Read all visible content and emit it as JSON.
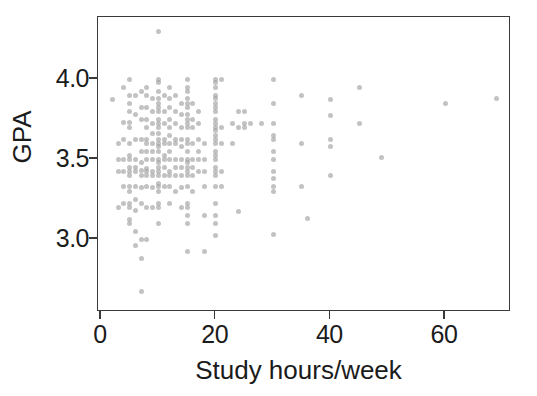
{
  "chart_data": {
    "type": "scatter",
    "title": "",
    "xlabel": "Study hours/week",
    "ylabel": "GPA",
    "xlim": [
      0,
      72
    ],
    "ylim": [
      2.6,
      4.38
    ],
    "xticks": [
      0,
      20,
      40,
      60
    ],
    "xtick_labels": [
      "0",
      "20",
      "40",
      "60"
    ],
    "yticks": [
      3.0,
      3.5,
      4.0
    ],
    "ytick_labels": [
      "3.0",
      "3.5",
      "4.0"
    ],
    "grid": false,
    "legend": false,
    "marker": {
      "shape": "circle",
      "color": "#9c9c9c",
      "opacity": 0.62,
      "size_px": 5
    },
    "frame_color": "#3a3a3a",
    "background_color": "#ffffff",
    "n_points": 232,
    "points": [
      [
        2,
        3.87
      ],
      [
        3,
        3.5
      ],
      [
        3,
        3.6
      ],
      [
        3,
        3.42
      ],
      [
        3,
        3.2
      ],
      [
        4,
        3.95
      ],
      [
        4,
        3.73
      ],
      [
        4,
        3.62
      ],
      [
        4,
        3.5
      ],
      [
        4,
        3.42
      ],
      [
        4,
        3.33
      ],
      [
        4,
        3.22
      ],
      [
        5,
        4.0
      ],
      [
        5,
        3.9
      ],
      [
        5,
        3.85
      ],
      [
        5,
        3.8
      ],
      [
        5,
        3.73
      ],
      [
        5,
        3.7
      ],
      [
        5,
        3.6
      ],
      [
        5,
        3.52
      ],
      [
        5,
        3.5
      ],
      [
        5,
        3.45
      ],
      [
        5,
        3.42
      ],
      [
        5,
        3.4
      ],
      [
        5,
        3.33
      ],
      [
        5,
        3.3
      ],
      [
        5,
        3.22
      ],
      [
        5,
        3.2
      ],
      [
        5,
        3.12
      ],
      [
        5,
        3.1
      ],
      [
        6,
        3.9
      ],
      [
        6,
        3.78
      ],
      [
        6,
        3.62
      ],
      [
        6,
        3.5
      ],
      [
        6,
        3.45
      ],
      [
        6,
        3.42
      ],
      [
        6,
        3.33
      ],
      [
        6,
        3.25
      ],
      [
        6,
        3.18
      ],
      [
        6,
        3.05
      ],
      [
        6,
        2.96
      ],
      [
        7,
        3.92
      ],
      [
        7,
        3.82
      ],
      [
        7,
        3.75
      ],
      [
        7,
        3.62
      ],
      [
        7,
        3.55
      ],
      [
        7,
        3.48
      ],
      [
        7,
        3.43
      ],
      [
        7,
        3.4
      ],
      [
        7,
        3.32
      ],
      [
        7,
        3.22
      ],
      [
        7,
        3.0
      ],
      [
        7,
        2.88
      ],
      [
        7,
        2.67
      ],
      [
        8,
        3.95
      ],
      [
        8,
        3.9
      ],
      [
        8,
        3.82
      ],
      [
        8,
        3.75
      ],
      [
        8,
        3.7
      ],
      [
        8,
        3.62
      ],
      [
        8,
        3.6
      ],
      [
        8,
        3.55
      ],
      [
        8,
        3.5
      ],
      [
        8,
        3.44
      ],
      [
        8,
        3.42
      ],
      [
        8,
        3.4
      ],
      [
        8,
        3.33
      ],
      [
        8,
        3.2
      ],
      [
        8,
        3.0
      ],
      [
        9,
        3.88
      ],
      [
        9,
        3.8
      ],
      [
        9,
        3.72
      ],
      [
        9,
        3.66
      ],
      [
        9,
        3.6
      ],
      [
        9,
        3.55
      ],
      [
        9,
        3.5
      ],
      [
        9,
        3.42
      ],
      [
        9,
        3.4
      ],
      [
        9,
        3.32
      ],
      [
        9,
        3.2
      ],
      [
        10,
        4.3
      ],
      [
        10,
        4.0
      ],
      [
        10,
        3.98
      ],
      [
        10,
        3.92
      ],
      [
        10,
        3.88
      ],
      [
        10,
        3.85
      ],
      [
        10,
        3.82
      ],
      [
        10,
        3.8
      ],
      [
        10,
        3.75
      ],
      [
        10,
        3.72
      ],
      [
        10,
        3.7
      ],
      [
        10,
        3.66
      ],
      [
        10,
        3.62
      ],
      [
        10,
        3.6
      ],
      [
        10,
        3.58
      ],
      [
        10,
        3.55
      ],
      [
        10,
        3.5
      ],
      [
        10,
        3.48
      ],
      [
        10,
        3.45
      ],
      [
        10,
        3.42
      ],
      [
        10,
        3.4
      ],
      [
        10,
        3.35
      ],
      [
        10,
        3.33
      ],
      [
        10,
        3.3
      ],
      [
        10,
        3.22
      ],
      [
        10,
        3.2
      ],
      [
        10,
        3.1
      ],
      [
        11,
        3.9
      ],
      [
        11,
        3.8
      ],
      [
        11,
        3.72
      ],
      [
        11,
        3.62
      ],
      [
        11,
        3.6
      ],
      [
        11,
        3.52
      ],
      [
        11,
        3.5
      ],
      [
        11,
        3.45
      ],
      [
        11,
        3.4
      ],
      [
        11,
        3.33
      ],
      [
        12,
        3.95
      ],
      [
        12,
        3.88
      ],
      [
        12,
        3.82
      ],
      [
        12,
        3.75
      ],
      [
        12,
        3.7
      ],
      [
        12,
        3.65
      ],
      [
        12,
        3.6
      ],
      [
        12,
        3.55
      ],
      [
        12,
        3.5
      ],
      [
        12,
        3.42
      ],
      [
        12,
        3.4
      ],
      [
        12,
        3.33
      ],
      [
        12,
        3.22
      ],
      [
        13,
        3.9
      ],
      [
        13,
        3.8
      ],
      [
        13,
        3.72
      ],
      [
        13,
        3.62
      ],
      [
        13,
        3.6
      ],
      [
        13,
        3.5
      ],
      [
        13,
        3.45
      ],
      [
        13,
        3.4
      ],
      [
        13,
        3.3
      ],
      [
        14,
        3.85
      ],
      [
        14,
        3.78
      ],
      [
        14,
        3.7
      ],
      [
        14,
        3.62
      ],
      [
        14,
        3.58
      ],
      [
        14,
        3.5
      ],
      [
        14,
        3.45
      ],
      [
        14,
        3.4
      ],
      [
        14,
        3.32
      ],
      [
        14,
        3.2
      ],
      [
        15,
        4.0
      ],
      [
        15,
        3.95
      ],
      [
        15,
        3.92
      ],
      [
        15,
        3.88
      ],
      [
        15,
        3.85
      ],
      [
        15,
        3.82
      ],
      [
        15,
        3.78
      ],
      [
        15,
        3.75
      ],
      [
        15,
        3.72
      ],
      [
        15,
        3.7
      ],
      [
        15,
        3.62
      ],
      [
        15,
        3.6
      ],
      [
        15,
        3.55
      ],
      [
        15,
        3.5
      ],
      [
        15,
        3.48
      ],
      [
        15,
        3.45
      ],
      [
        15,
        3.42
      ],
      [
        15,
        3.4
      ],
      [
        15,
        3.33
      ],
      [
        15,
        3.22
      ],
      [
        15,
        3.2
      ],
      [
        15,
        3.15
      ],
      [
        15,
        3.1
      ],
      [
        15,
        2.92
      ],
      [
        16,
        3.85
      ],
      [
        16,
        3.75
      ],
      [
        16,
        3.7
      ],
      [
        16,
        3.6
      ],
      [
        16,
        3.5
      ],
      [
        16,
        3.45
      ],
      [
        16,
        3.4
      ],
      [
        16,
        3.3
      ],
      [
        17,
        3.8
      ],
      [
        17,
        3.72
      ],
      [
        17,
        3.62
      ],
      [
        17,
        3.55
      ],
      [
        17,
        3.5
      ],
      [
        17,
        3.42
      ],
      [
        18,
        3.6
      ],
      [
        18,
        3.5
      ],
      [
        18,
        3.42
      ],
      [
        18,
        3.33
      ],
      [
        18,
        3.15
      ],
      [
        18,
        2.92
      ],
      [
        20,
        4.0
      ],
      [
        20,
        3.98
      ],
      [
        20,
        3.95
      ],
      [
        20,
        3.9
      ],
      [
        20,
        3.88
      ],
      [
        20,
        3.85
      ],
      [
        20,
        3.82
      ],
      [
        20,
        3.8
      ],
      [
        20,
        3.75
      ],
      [
        20,
        3.72
      ],
      [
        20,
        3.7
      ],
      [
        20,
        3.68
      ],
      [
        20,
        3.65
      ],
      [
        20,
        3.62
      ],
      [
        20,
        3.6
      ],
      [
        20,
        3.55
      ],
      [
        20,
        3.52
      ],
      [
        20,
        3.5
      ],
      [
        20,
        3.45
      ],
      [
        20,
        3.42
      ],
      [
        20,
        3.4
      ],
      [
        20,
        3.33
      ],
      [
        20,
        3.22
      ],
      [
        20,
        3.15
      ],
      [
        20,
        3.1
      ],
      [
        20,
        3.02
      ],
      [
        21,
        4.0
      ],
      [
        21,
        3.7
      ],
      [
        21,
        3.6
      ],
      [
        21,
        3.42
      ],
      [
        21,
        3.33
      ],
      [
        23,
        3.72
      ],
      [
        23,
        3.6
      ],
      [
        24,
        3.8
      ],
      [
        24,
        3.7
      ],
      [
        24,
        3.17
      ],
      [
        25,
        3.8
      ],
      [
        25,
        3.72
      ],
      [
        25,
        3.7
      ],
      [
        26,
        3.72
      ],
      [
        28,
        3.72
      ],
      [
        30,
        4.0
      ],
      [
        30,
        3.85
      ],
      [
        30,
        3.72
      ],
      [
        30,
        3.65
      ],
      [
        30,
        3.62
      ],
      [
        30,
        3.55
      ],
      [
        30,
        3.5
      ],
      [
        30,
        3.42
      ],
      [
        30,
        3.38
      ],
      [
        30,
        3.33
      ],
      [
        30,
        3.3
      ],
      [
        30,
        3.03
      ],
      [
        35,
        3.9
      ],
      [
        35,
        3.6
      ],
      [
        35,
        3.33
      ],
      [
        36,
        3.13
      ],
      [
        40,
        3.87
      ],
      [
        40,
        3.77
      ],
      [
        40,
        3.62
      ],
      [
        40,
        3.58
      ],
      [
        40,
        3.4
      ],
      [
        45,
        3.95
      ],
      [
        45,
        3.72
      ],
      [
        49,
        3.51
      ],
      [
        60,
        3.85
      ],
      [
        69,
        3.88
      ]
    ]
  },
  "axes": {
    "xlabel": "Study hours/week",
    "ylabel": "GPA",
    "xtick_labels": [
      "0",
      "20",
      "40",
      "60"
    ],
    "ytick_labels": [
      "3.0",
      "3.5",
      "4.0"
    ]
  }
}
